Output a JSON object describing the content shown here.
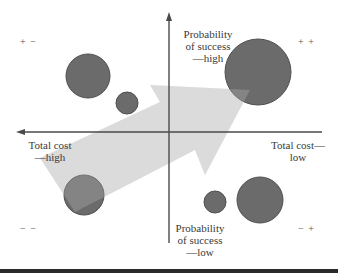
{
  "colors": {
    "axis": "#4a4a4a",
    "bubble_fill": "#6b6b6b",
    "bubble_stroke": "#4f4f4f",
    "arrow_fill": "#d9d9d9",
    "rule": "#2a2a2a"
  },
  "axes": {
    "y_top_label": [
      "Probability",
      "of success",
      "—high"
    ],
    "y_bottom_label": [
      "Probability",
      "of success",
      "—low"
    ],
    "x_left_label": [
      "Total cost",
      "—high"
    ],
    "x_right_label": [
      "Total cost—",
      "low"
    ]
  },
  "quadrants": {
    "top_left": "+ −",
    "top_right": "+ +",
    "bottom_left": "− −",
    "bottom_right": "− +"
  },
  "bubbles": [
    {
      "id": "upper-left-large",
      "cx": 88,
      "cy": 76,
      "r": 22
    },
    {
      "id": "upper-left-small",
      "cx": 127,
      "cy": 103,
      "r": 11
    },
    {
      "id": "upper-right-large",
      "cx": 258,
      "cy": 72,
      "r": 33
    },
    {
      "id": "lower-left",
      "cx": 84,
      "cy": 195,
      "r": 20
    },
    {
      "id": "lower-right-small",
      "cx": 215,
      "cy": 202,
      "r": 11
    },
    {
      "id": "lower-right",
      "cx": 260,
      "cy": 200,
      "r": 23
    }
  ],
  "trend_arrow": {
    "direction": "lower-left to upper-right"
  }
}
